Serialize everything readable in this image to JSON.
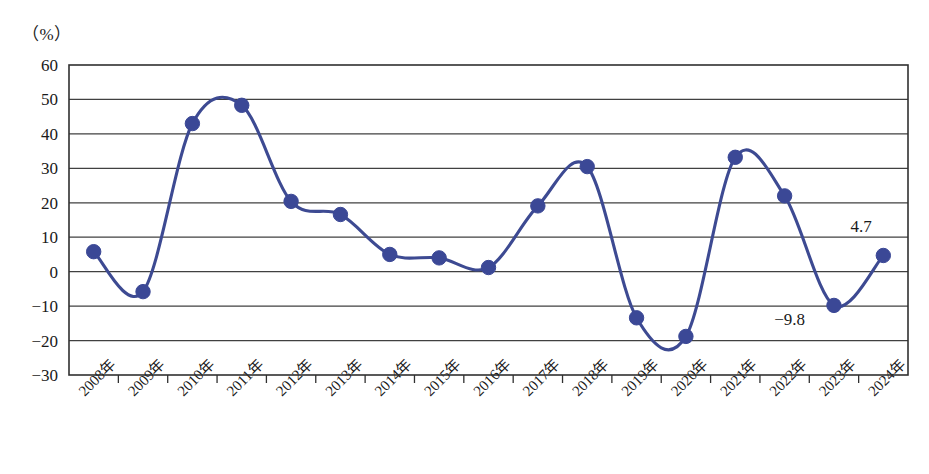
{
  "axis": {
    "unit_label": "（%）",
    "y_ticks": [
      "60",
      "50",
      "40",
      "30",
      "20",
      "10",
      "0",
      "-10",
      "-20",
      "-30"
    ]
  },
  "colors": {
    "series": "#3d4a92",
    "marker": "#3b4896",
    "grid": "#404040",
    "frame": "#303030",
    "text": "#1a1a1a",
    "background": "#ffffff"
  },
  "annotations": [
    {
      "text": "4.7",
      "x_index": 15.55,
      "y_value": 11.5
    },
    {
      "text": "-9.8",
      "x_index": 14.1,
      "y_value": -15.5
    }
  ],
  "chart_data": {
    "type": "line",
    "title": "",
    "xlabel": "",
    "ylabel": "",
    "unit": "%",
    "ylim": [
      -30,
      60
    ],
    "ytick_step": 10,
    "grid": true,
    "legend": "none",
    "categories": [
      "2008年",
      "2009年",
      "2010年",
      "2011年",
      "2012年",
      "2013年",
      "2014年",
      "2015年",
      "2016年",
      "2017年",
      "2018年",
      "2019年",
      "2020年",
      "2021年",
      "2022年",
      "2023年",
      "2024年"
    ],
    "series": [
      {
        "name": "增长率",
        "values": [
          5.8,
          -5.8,
          43.0,
          48.3,
          20.4,
          16.6,
          5.0,
          4.0,
          1.2,
          19.1,
          30.5,
          -13.4,
          -18.8,
          33.2,
          22.0,
          -9.8,
          4.7
        ]
      }
    ]
  }
}
